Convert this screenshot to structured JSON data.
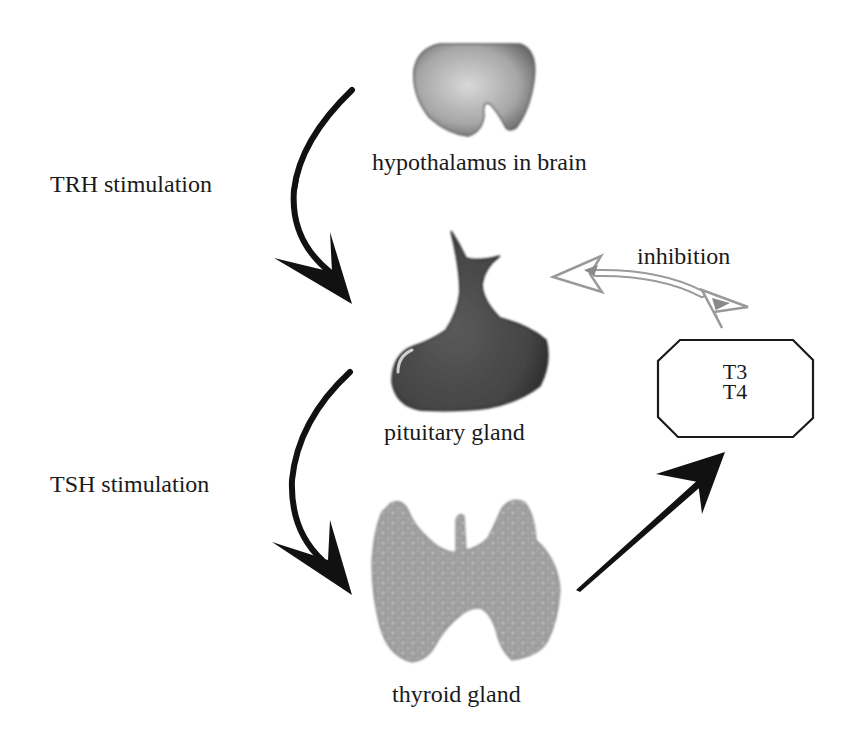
{
  "diagram": {
    "nodes": {
      "hypothalamus": {
        "label": "hypothalamus in brain",
        "fill": "#a8a8a8"
      },
      "pituitary": {
        "label": "pituitary gland",
        "fill": "#4a4a4a"
      },
      "thyroid": {
        "label": "thyroid gland",
        "fill": "#9a9a9a"
      },
      "hormones": {
        "line1": "T3",
        "line2": "T4"
      }
    },
    "edges": {
      "trh": {
        "label": "TRH stimulation",
        "from": "hypothalamus",
        "to": "pituitary",
        "color": "#111111"
      },
      "tsh": {
        "label": "TSH stimulation",
        "from": "pituitary",
        "to": "thyroid",
        "color": "#111111"
      },
      "release": {
        "label": "",
        "from": "thyroid",
        "to": "hormones",
        "color": "#111111"
      },
      "inhibition": {
        "label": "inhibition",
        "from": "hormones",
        "to": "pituitary",
        "color": "#9a9a9a"
      }
    }
  }
}
